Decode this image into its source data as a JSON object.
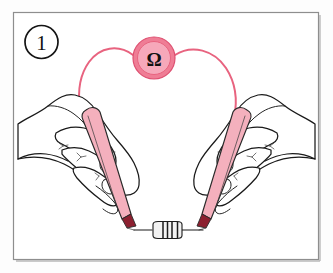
{
  "figure": {
    "title": "Measuring resistance of a resistor with a multimeter probe pair",
    "step_number": "1",
    "step_badge_name": "step-number-badge",
    "frame": {
      "x": 13,
      "y": 12,
      "width": 306,
      "height": 248,
      "border_color": "#8e8e8e",
      "background_color": "#ffffff"
    },
    "canvas": {
      "width": 333,
      "height": 273,
      "background_color": "#fdfdfd"
    }
  },
  "meter": {
    "symbol": "Ω",
    "symbol_name": "ohm-symbol",
    "disc_color": "#ef7d95",
    "disc_inner_color": "#f6a8ba",
    "disc_center_x": 154,
    "disc_center_y": 58,
    "disc_radius": 21
  },
  "leads": {
    "wire_color": "#e8637f",
    "left_label": "left-test-lead-wire",
    "right_label": "right-test-lead-wire"
  },
  "probes": [
    {
      "name": "left-probe",
      "body_color": "#f4b0bd",
      "tip_color": "#8c2030",
      "outline_color": "#2a2a2a"
    },
    {
      "name": "right-probe",
      "body_color": "#f4b0bd",
      "tip_color": "#8c2030",
      "outline_color": "#2a2a2a"
    }
  ],
  "hands": [
    {
      "name": "left-hand",
      "fill": "#ffffff",
      "outline": "#1a1a1a"
    },
    {
      "name": "right-hand",
      "fill": "#ffffff",
      "outline": "#1a1a1a"
    }
  ],
  "component": {
    "name": "resistor",
    "body_color": "#f2f2f2",
    "band_color": "#1a1a1a",
    "band_count": 4,
    "center_x": 167,
    "center_y": 229
  }
}
